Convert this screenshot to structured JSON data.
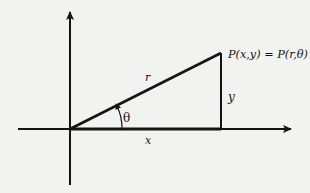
{
  "diagram": {
    "colors": {
      "background": "#f2f2f0",
      "ink": "#141414"
    },
    "axes": {
      "x_axis": {
        "arrow": "right"
      },
      "y_axis": {
        "arrow": "up"
      }
    },
    "labels": {
      "point": "P(x,y) = P(r,θ)",
      "hypotenuse": "r",
      "vertical_side": "y",
      "horizontal_side": "x",
      "angle": "θ"
    }
  }
}
